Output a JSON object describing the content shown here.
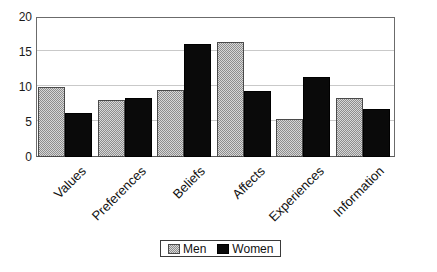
{
  "chart_data": {
    "type": "bar",
    "title": "",
    "subtitle": "",
    "xlabel": "",
    "ylabel": "",
    "ylim": [
      0,
      20
    ],
    "yticks": [
      0,
      5,
      10,
      15,
      20
    ],
    "grid": true,
    "legend_position": "bottom",
    "categories": [
      "Values",
      "Preferences",
      "Beliefs",
      "Affects",
      "Experiences",
      "Information"
    ],
    "series": [
      {
        "name": "Men",
        "color": "#b4b4b4",
        "values": [
          10.0,
          8.2,
          9.6,
          16.5,
          5.4,
          8.4
        ]
      },
      {
        "name": "Women",
        "color": "#0a0a0a",
        "values": [
          6.3,
          8.5,
          16.2,
          9.5,
          11.4,
          6.8
        ]
      }
    ]
  },
  "legend": {
    "items": [
      {
        "label": "Men",
        "swatch": "men-swatch"
      },
      {
        "label": "Women",
        "swatch": "women-swatch"
      }
    ]
  }
}
